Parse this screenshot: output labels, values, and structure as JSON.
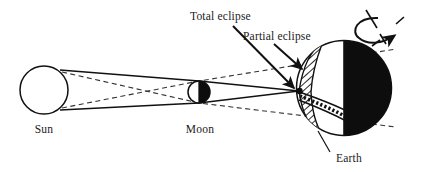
{
  "diagram": {
    "background_color": "#ffffff",
    "ink_color": "#111111",
    "labels": {
      "sun": "Sun",
      "moon": "Moon",
      "earth": "Earth",
      "total_eclipse": "Total eclipse",
      "partial_eclipse": "Partial eclipse"
    },
    "bodies": [
      {
        "name": "sun",
        "label": "Sun",
        "shape": "circle",
        "cx": 44,
        "cy": 90,
        "r": 24,
        "fill": "#ffffff",
        "stroke": "#111111"
      },
      {
        "name": "moon",
        "label": "Moon",
        "shape": "circle-half-shadowed",
        "cx": 199,
        "cy": 92,
        "r": 11,
        "lit_side": "left",
        "lit_fill": "#ffffff",
        "dark_fill": "#0d0d0d"
      },
      {
        "name": "earth",
        "label": "Earth",
        "shape": "circle-half-shadowed",
        "cx": 344,
        "cy": 88,
        "r": 48,
        "lit_side": "left",
        "lit_fill": "#ffffff",
        "dark_fill": "#0d0d0d",
        "terminator_x": 344
      }
    ],
    "shadow_zones": [
      {
        "name": "umbra",
        "line_style": "solid",
        "label": "Total eclipse",
        "converges_at_x": 299,
        "converges_at_y": 91
      },
      {
        "name": "penumbra",
        "line_style": "dashed",
        "label": "Partial eclipse",
        "fill_pattern": "diagonal-hatch"
      }
    ],
    "rotation_indicator": {
      "name": "earth-rotation",
      "axis_tilt_degrees": 23,
      "arrow_direction": "counterclockwise-to-east",
      "style": "dashed-axis-with-curved-arrow"
    },
    "annotations": [
      {
        "name": "total-eclipse-annotation",
        "text": "Total eclipse",
        "text_x": 190,
        "text_y": 18,
        "arrow_from_x": 233,
        "arrow_from_y": 26,
        "arrow_to_x": 296,
        "arrow_to_y": 90
      },
      {
        "name": "partial-eclipse-annotation",
        "text": "Partial eclipse",
        "text_x": 243,
        "text_y": 38,
        "arrow_from_x": 271,
        "arrow_from_y": 44,
        "arrow_to_x": 303,
        "arrow_to_y": 72
      },
      {
        "name": "earth-leader",
        "text": "Earth",
        "text_x": 333,
        "text_y": 158,
        "leader_from_x": 329,
        "leader_from_y": 152,
        "leader_to_x": 318,
        "leader_to_y": 131
      }
    ]
  }
}
